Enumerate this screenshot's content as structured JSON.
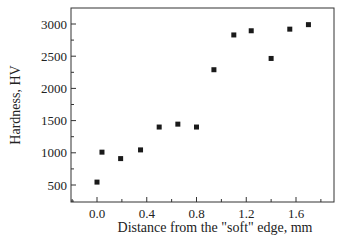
{
  "chart_data": {
    "type": "scatter",
    "title": "",
    "xlabel": "Distance from the \"soft\" edge, mm",
    "ylabel": "Hardness, HV",
    "xlim": [
      -0.2,
      1.85
    ],
    "ylim": [
      250,
      3250
    ],
    "x_ticks": [
      0.0,
      0.4,
      0.8,
      1.2,
      1.6
    ],
    "x_tick_labels": [
      "0.0",
      "0.4",
      "0.8",
      "1.2",
      "1.6"
    ],
    "y_ticks": [
      500,
      1000,
      1500,
      2000,
      2500,
      3000
    ],
    "y_tick_labels": [
      "500",
      "1000",
      "1500",
      "2000",
      "2500",
      "3000"
    ],
    "grid": false,
    "legend": null,
    "marker": "square",
    "marker_color": "#1a1a1a",
    "series": [
      {
        "name": "Hardness",
        "x": [
          0.0,
          0.04,
          0.19,
          0.35,
          0.5,
          0.65,
          0.8,
          0.94,
          1.1,
          1.24,
          1.4,
          1.55,
          1.7
        ],
        "y": [
          545,
          1010,
          910,
          1045,
          1400,
          1445,
          1400,
          2290,
          2830,
          2895,
          2465,
          2920,
          2990
        ]
      }
    ]
  }
}
